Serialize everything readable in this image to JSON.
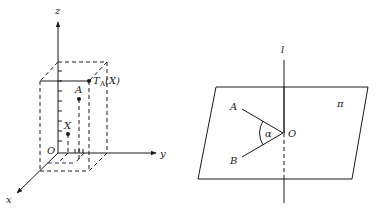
{
  "figure_left": {
    "title": "3D coordinate box with translation",
    "axes": {
      "z_label": "z",
      "y_label": "y",
      "x_label": "x",
      "origin_label": "O"
    },
    "points": {
      "X_label": "X",
      "A_label": "A",
      "T_main": "T",
      "T_sub": "A",
      "T_arg": "(X)"
    }
  },
  "figure_right": {
    "title": "Plane with line and angle",
    "labels": {
      "line": "l",
      "plane": "π",
      "A": "A",
      "B": "B",
      "O": "O",
      "angle": "α"
    }
  },
  "colors": {
    "ink": "#1a1a1a",
    "background": "#ffffff"
  }
}
